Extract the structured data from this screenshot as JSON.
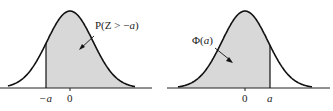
{
  "left_panel": {
    "label_prefix": "P(Z > −",
    "label_var": "a",
    "label_suffix": ")",
    "ticks": [
      {
        "text": "−a",
        "x": 46
      },
      {
        "text": "0",
        "x": 70
      }
    ],
    "shaded_region": "x > -a"
  },
  "right_panel": {
    "label_prefix": "Φ(",
    "label_var": "a",
    "label_suffix": ")",
    "ticks": [
      {
        "text": "0",
        "x": 245
      },
      {
        "text": "a",
        "x": 270
      }
    ],
    "shaded_region": "x < a"
  },
  "colors": {
    "curve": "#111111",
    "shade": "#d8d8d8",
    "axis": "#222222"
  }
}
